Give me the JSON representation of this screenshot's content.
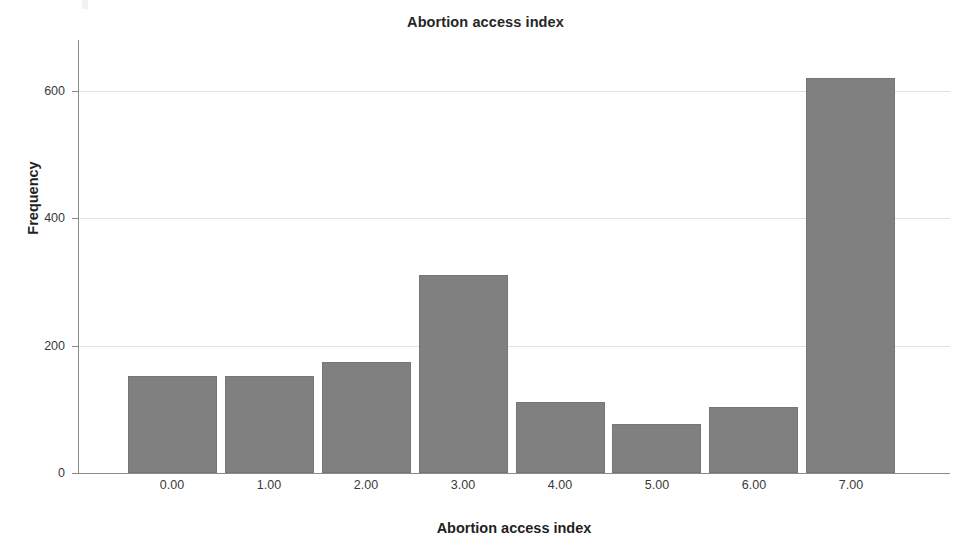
{
  "chart_data": {
    "type": "bar",
    "title": "Abortion access index",
    "xlabel": "Abortion access index",
    "ylabel": "Frequency",
    "categories": [
      "0.00",
      "1.00",
      "2.00",
      "3.00",
      "4.00",
      "5.00",
      "6.00",
      "7.00"
    ],
    "values": [
      153,
      152,
      174,
      311,
      112,
      77,
      104,
      620
    ],
    "ylim": [
      0,
      680
    ],
    "yticks": [
      0,
      200,
      400,
      600
    ],
    "ytick_labels": [
      "0",
      "200",
      "400",
      "600"
    ],
    "grid": true,
    "grid_axis": "y",
    "legend": null,
    "bar_color": "#808080",
    "background_color": "#ffffff",
    "axis_color": "#8a8a8a",
    "gridline_color": "#e2e2e2"
  }
}
